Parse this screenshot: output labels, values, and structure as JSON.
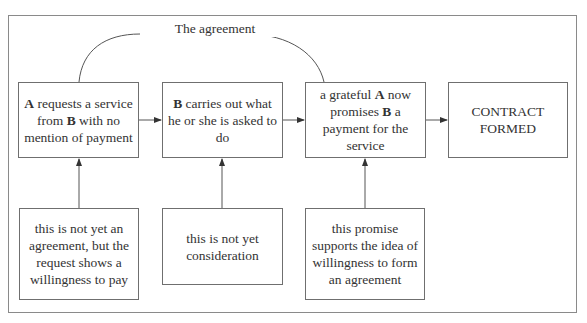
{
  "diagram": {
    "title_label": "The agreement",
    "steps": [
      {
        "id": "step1",
        "text_parts": [
          {
            "t": "A",
            "b": true
          },
          {
            "t": " requests a service from ",
            "b": false
          },
          {
            "t": "B",
            "b": true
          },
          {
            "t": " with no mention of payment",
            "b": false
          }
        ]
      },
      {
        "id": "step2",
        "text_parts": [
          {
            "t": "B",
            "b": true
          },
          {
            "t": " carries out what he or she is asked to do",
            "b": false
          }
        ]
      },
      {
        "id": "step3",
        "text_parts": [
          {
            "t": "a grateful ",
            "b": false
          },
          {
            "t": "A",
            "b": true
          },
          {
            "t": " now promises ",
            "b": false
          },
          {
            "t": "B",
            "b": true
          },
          {
            "t": " a payment for the service",
            "b": false
          }
        ]
      },
      {
        "id": "step4",
        "text_parts": [
          {
            "t": "CONTRACT FORMED",
            "b": false
          }
        ]
      }
    ],
    "notes": [
      {
        "id": "note1",
        "text": "this is not yet an agreement, but the request shows a willingness to pay"
      },
      {
        "id": "note2",
        "text": "this is not yet consideration"
      },
      {
        "id": "note3",
        "text": "this promise supports the idea of willingness to form an agreement"
      }
    ],
    "connections": [
      {
        "from": "step1",
        "to": "step2",
        "type": "arrow"
      },
      {
        "from": "step2",
        "to": "step3",
        "type": "arrow"
      },
      {
        "from": "step3",
        "to": "step4",
        "type": "arrow"
      },
      {
        "from": "note1",
        "to": "step1",
        "type": "arrow"
      },
      {
        "from": "note2",
        "to": "step2",
        "type": "arrow"
      },
      {
        "from": "note3",
        "to": "step3",
        "type": "arrow"
      },
      {
        "from": "step1",
        "to": "step3",
        "type": "curve",
        "label": "The agreement"
      }
    ],
    "colors": {
      "line": "#555555",
      "frame": "#8a8a8a",
      "text": "#333333"
    }
  }
}
